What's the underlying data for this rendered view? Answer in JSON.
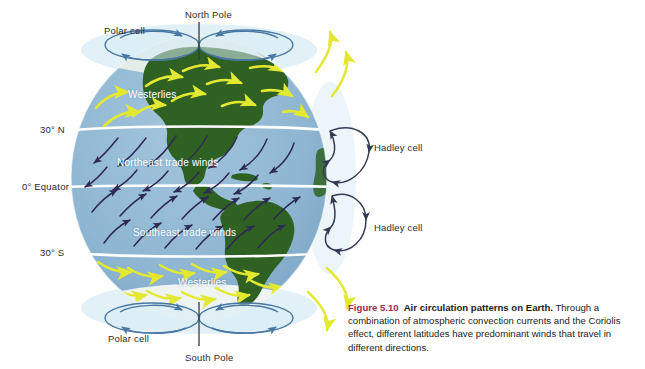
{
  "figure": {
    "id": "air-circulation-figure",
    "globe": {
      "ocean_color": "#8fb6d2",
      "land_color": "#2f6123",
      "ice_color": "#dfe7e2",
      "latitude_line_color": "#ffffff",
      "center_x": 199,
      "center_y": 178,
      "radius_x": 128,
      "radius_y": 142
    },
    "arrow_colors": {
      "westerlies": "#e3e831",
      "trade_winds": "#2e2a56",
      "cell_loop": "#3c5f85",
      "polar_cell": "#4a78a3"
    },
    "labels": {
      "polar_cell_north": "Polar cell",
      "north_pole": "North Pole",
      "polar_cell_south": "Polar cell",
      "south_pole": "South Pole",
      "hadley_cell_north": "Hadley cell",
      "hadley_cell_south": "Hadley cell"
    },
    "latitudes": [
      {
        "name": "30n",
        "label": "30° N",
        "y": 130
      },
      {
        "name": "equator",
        "label": "0° Equator",
        "y": 187
      },
      {
        "name": "30s",
        "label": "30° S",
        "y": 253
      }
    ],
    "wind_bands": [
      {
        "name": "westerlies-north",
        "label": "Westerlies",
        "arrow_color": "#e3e831"
      },
      {
        "name": "northeast-trade-winds",
        "label": "Northeast trade winds",
        "arrow_color": "#2e2a56"
      },
      {
        "name": "southeast-trade-winds",
        "label": "Southeast trade winds",
        "arrow_color": "#2e2a56"
      },
      {
        "name": "westerlies-south",
        "label": "Westerlies",
        "arrow_color": "#e3e831"
      }
    ]
  },
  "caption": {
    "figure_number": "Figure 5.10",
    "lead": "Air circulation patterns on Earth.",
    "body": " Through a combination of atmospheric convection currents and the Coriolis effect, different latitudes have predominant winds that travel in different directions.",
    "accent_color": "#9c2b4e"
  }
}
